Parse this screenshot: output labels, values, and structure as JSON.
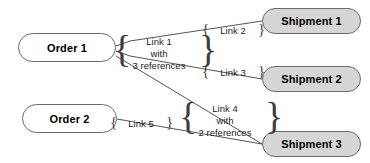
{
  "diagram": {
    "type": "node-link-graph",
    "colors": {
      "node_order_fill": "#ffffff",
      "node_shipment_fill": "#d6d6d6",
      "node_stroke": "#6b6b6b",
      "edge_stroke": "#555555",
      "text": "#000000",
      "background": "#ffffff"
    },
    "nodes": [
      {
        "id": "order1",
        "label": "Order 1",
        "kind": "order",
        "x": 18,
        "y": 33,
        "w": 98,
        "h": 29
      },
      {
        "id": "order2",
        "label": "Order 2",
        "kind": "order",
        "x": 22,
        "y": 104,
        "w": 95,
        "h": 29
      },
      {
        "id": "shipment1",
        "label": "Shipment 1",
        "kind": "shipment",
        "x": 262,
        "y": 8,
        "w": 99,
        "h": 26
      },
      {
        "id": "shipment2",
        "label": "Shipment 2",
        "kind": "shipment",
        "x": 262,
        "y": 66,
        "w": 99,
        "h": 26
      },
      {
        "id": "shipment3",
        "label": "Shipment 3",
        "kind": "shipment",
        "x": 262,
        "y": 131,
        "w": 99,
        "h": 26
      }
    ],
    "edge_labels": [
      {
        "id": "link1",
        "lines": [
          "Link 1",
          "with",
          "3 references"
        ],
        "brace_left": "{",
        "brace_right": "}",
        "x": 120,
        "y": 36,
        "w": 78,
        "tall": true
      },
      {
        "id": "link2",
        "lines": [
          "Link 2"
        ],
        "brace_left": "{",
        "brace_right": "}",
        "x": 209,
        "y": 25,
        "w": 48,
        "tall": false
      },
      {
        "id": "link3",
        "lines": [
          "Link 3"
        ],
        "brace_left": "{",
        "brace_right": "}",
        "x": 209,
        "y": 67,
        "w": 48,
        "tall": false
      },
      {
        "id": "link4",
        "lines": [
          "Link 4",
          "with",
          "2 references"
        ],
        "brace_left": "{",
        "brace_right": "}",
        "x": 186,
        "y": 103,
        "w": 78,
        "tall": true
      },
      {
        "id": "link5",
        "lines": [
          "Link 5"
        ],
        "brace_left": "{",
        "brace_right": "}",
        "x": 117,
        "y": 118,
        "w": 48,
        "tall": false
      }
    ],
    "edges": [
      {
        "id": "e-order1-shipment1",
        "from": "order1",
        "to": "shipment1",
        "path": "M116,46 L130,41 L262,21"
      },
      {
        "id": "e-order1-shipment2",
        "from": "order1",
        "to": "shipment2",
        "path": "M116,51 L130,56 L262,79"
      },
      {
        "id": "e-order1-shipment3",
        "from": "order1",
        "to": "shipment3",
        "path": "M116,56 L262,144"
      },
      {
        "id": "e-order2-shipment3",
        "from": "order2",
        "to": "shipment3",
        "path": "M117,119 L262,144"
      }
    ]
  }
}
